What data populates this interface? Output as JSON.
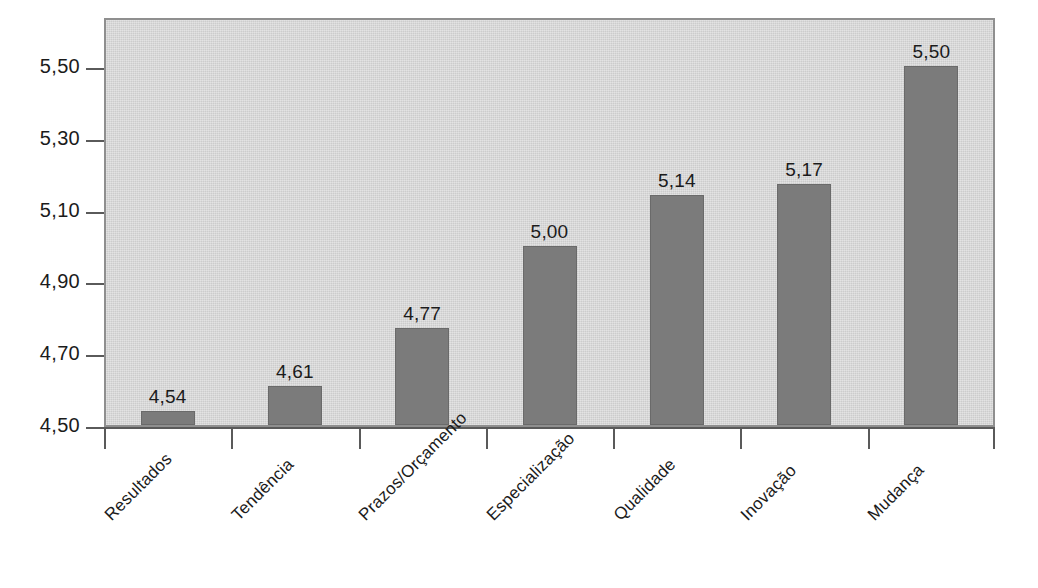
{
  "chart_data": {
    "type": "bar",
    "title": "",
    "subtitle": "",
    "xlabel": "",
    "ylabel": "",
    "categories": [
      "Resultados",
      "Tendência",
      "Prazos/Orçamento",
      "Especialização",
      "Qualidade",
      "Inovação",
      "Mudança"
    ],
    "values": [
      4.54,
      4.61,
      4.77,
      5.0,
      5.14,
      5.17,
      5.5
    ],
    "value_labels": [
      "4,54",
      "4,61",
      "4,77",
      "5,00",
      "5,14",
      "5,17",
      "5,50"
    ],
    "ylim": [
      4.5,
      5.6
    ],
    "y_ticks": [
      4.5,
      4.7,
      4.9,
      5.1,
      5.3,
      5.5
    ],
    "y_tick_labels": [
      "4,50",
      "4,70",
      "4,90",
      "5,10",
      "5,30",
      "5,50"
    ],
    "grid": false,
    "legend": false,
    "legend_position": "none",
    "decimal_separator": ",",
    "colors": {
      "bar_fill": "#7b7b7b",
      "bar_edge": "#6a6a6a",
      "plot_background": "#d4d4d4",
      "plot_border": "#8f8f8f",
      "page_background": "#ffffff",
      "axis": "#5a5a5a",
      "text": "#1b1b1b"
    }
  }
}
